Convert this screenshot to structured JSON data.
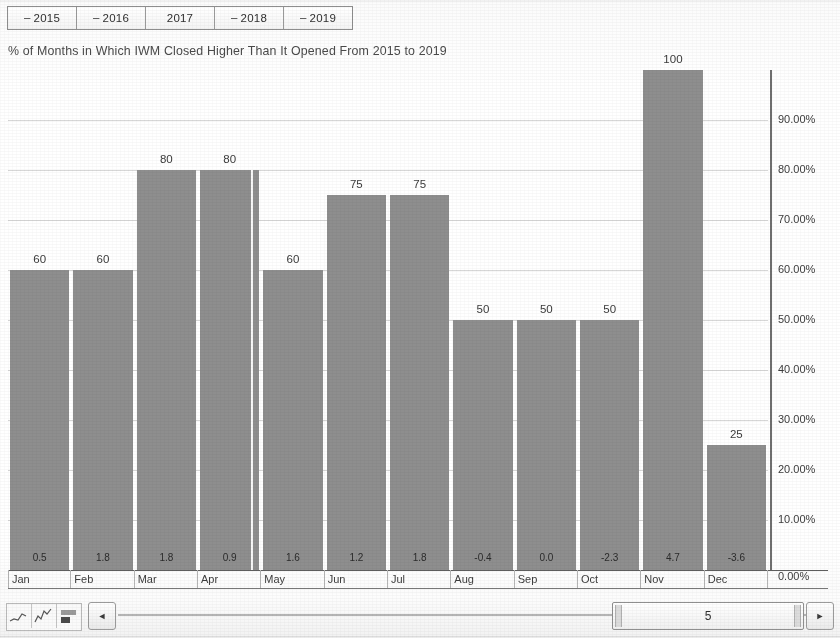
{
  "tabs": {
    "items": [
      {
        "label": "2015",
        "dash": "–",
        "selected": false
      },
      {
        "label": "2016",
        "dash": "–",
        "selected": false
      },
      {
        "label": "2017",
        "dash": "",
        "selected": true
      },
      {
        "label": "2018",
        "dash": "–",
        "selected": false
      },
      {
        "label": "2019",
        "dash": "–",
        "selected": false
      }
    ]
  },
  "title": "% of Months in Which IWM Closed Higher Than It Opened From 2015 to 2019",
  "axis": {
    "y_ticks": [
      "90.00%",
      "80.00%",
      "70.00%",
      "60.00%",
      "50.00%",
      "40.00%",
      "30.00%",
      "20.00%",
      "10.00%",
      "0.00%"
    ],
    "zero_label": "0.00%"
  },
  "toolbar": {
    "sheet_icons": [
      "line-chart-icon",
      "area-chart-icon",
      "bar-chart-icon"
    ],
    "left_arrow": "◄",
    "right_arrow": "►",
    "scroll_value": "5"
  },
  "chart_data": {
    "type": "bar",
    "title": "% of Months in Which IWM Closed Higher Than It Opened From 2015 to 2019",
    "xlabel": "",
    "ylabel": "",
    "ylim": [
      0,
      100
    ],
    "grid": true,
    "legend": "none",
    "categories": [
      "Jan",
      "Feb",
      "Mar",
      "Apr",
      "May",
      "Jun",
      "Jul",
      "Aug",
      "Sep",
      "Oct",
      "Nov",
      "Dec"
    ],
    "values": [
      60,
      60,
      80,
      80,
      60,
      75,
      75,
      50,
      50,
      50,
      100,
      25
    ],
    "value_labels": [
      "60",
      "60",
      "80",
      "80",
      "60",
      "75",
      "75",
      "50",
      "50",
      "50",
      "100",
      "25"
    ],
    "secondary_row_label": "avg % change",
    "secondary_values": [
      0.5,
      1.8,
      1.8,
      0.9,
      1.6,
      1.2,
      1.8,
      -0.4,
      0.0,
      -2.3,
      4.7,
      -3.6
    ],
    "secondary_value_labels": [
      "0.5",
      "1.8",
      "1.8",
      "0.9",
      "1.6",
      "1.2",
      "1.8",
      "-0.4",
      "0.0",
      "-2.3",
      "4.7",
      "-3.6"
    ],
    "y_tick_values": [
      90,
      80,
      70,
      60,
      50,
      40,
      30,
      20,
      10,
      0
    ],
    "y_tick_labels": [
      "90.00%",
      "80.00%",
      "70.00%",
      "60.00%",
      "50.00%",
      "40.00%",
      "30.00%",
      "20.00%",
      "10.00%",
      "0.00%"
    ],
    "bar_color": "#8e8e8e"
  }
}
